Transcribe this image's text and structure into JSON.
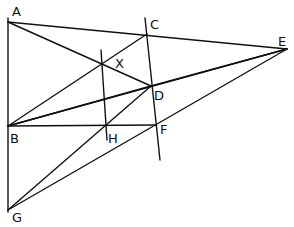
{
  "diagram": {
    "type": "geometric-construction",
    "labels": [
      {
        "id": "A",
        "text": "A",
        "x": 12,
        "y": 16
      },
      {
        "id": "C",
        "text": "C",
        "x": 150,
        "y": 29
      },
      {
        "id": "E",
        "text": "E",
        "x": 278,
        "y": 46
      },
      {
        "id": "X",
        "text": "X",
        "x": 115,
        "y": 68
      },
      {
        "id": "D",
        "text": "D",
        "x": 154,
        "y": 100
      },
      {
        "id": "B",
        "text": "B",
        "x": 10,
        "y": 143
      },
      {
        "id": "H",
        "text": "H",
        "x": 108,
        "y": 143
      },
      {
        "id": "F",
        "text": "F",
        "x": 160,
        "y": 134
      },
      {
        "id": "G",
        "text": "G",
        "x": 12,
        "y": 222
      }
    ],
    "points": {
      "A": [
        8,
        22
      ],
      "C": [
        147,
        34
      ],
      "E": [
        287,
        49
      ],
      "X": [
        102,
        62
      ],
      "D": [
        151,
        86
      ],
      "B": [
        8,
        126
      ],
      "H": [
        106,
        126
      ],
      "F": [
        156,
        125
      ],
      "G": [
        8,
        210
      ]
    },
    "segments": [
      {
        "name": "line-AG",
        "from": [
          8,
          18
        ],
        "to": [
          8,
          212
        ]
      },
      {
        "name": "line-AE",
        "from": [
          8,
          22
        ],
        "to": [
          287,
          49
        ]
      },
      {
        "name": "line-AD",
        "from": [
          8,
          22
        ],
        "to": [
          151,
          86
        ]
      },
      {
        "name": "line-CF",
        "from": [
          145,
          18
        ],
        "to": [
          160,
          160
        ]
      },
      {
        "name": "line-XH",
        "from": [
          101,
          50
        ],
        "to": [
          107,
          140
        ]
      },
      {
        "name": "line-BC",
        "from": [
          8,
          126
        ],
        "to": [
          147,
          34
        ]
      },
      {
        "name": "line-BD",
        "from": [
          8,
          126
        ],
        "to": [
          151,
          86
        ]
      },
      {
        "name": "line-BE",
        "from": [
          8,
          126
        ],
        "to": [
          287,
          49
        ]
      },
      {
        "name": "line-BF",
        "from": [
          8,
          126
        ],
        "to": [
          156,
          125
        ]
      },
      {
        "name": "line-GD",
        "from": [
          8,
          210
        ],
        "to": [
          151,
          86
        ]
      },
      {
        "name": "line-GE",
        "from": [
          8,
          210
        ],
        "to": [
          287,
          49
        ]
      },
      {
        "name": "line-DE",
        "from": [
          151,
          86
        ],
        "to": [
          287,
          49
        ]
      }
    ]
  }
}
